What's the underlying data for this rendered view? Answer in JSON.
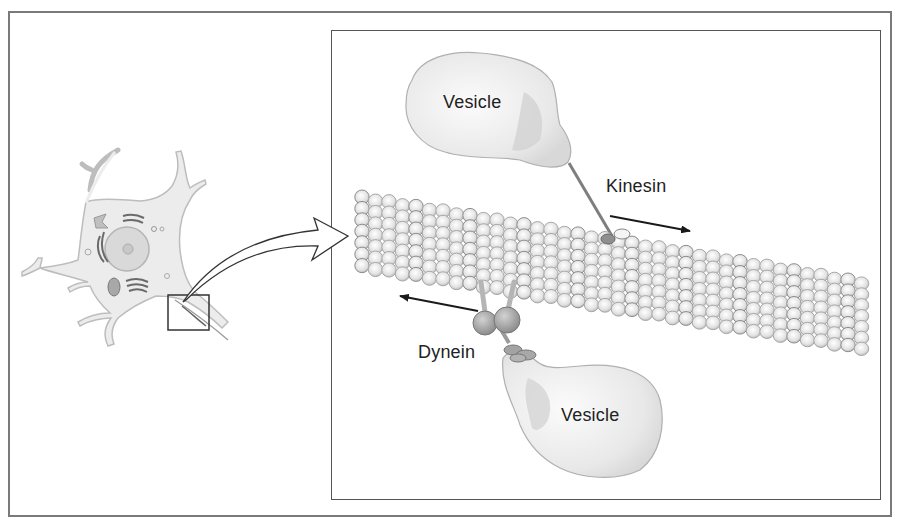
{
  "figure": {
    "left_panel": {
      "subject": "neuron-cell",
      "inset_marker": "zoom-region-box"
    },
    "right_panel": {
      "labels": {
        "vesicle_top": "Vesicle",
        "kinesin": "Kinesin",
        "dynein": "Dynein",
        "vesicle_bottom": "Vesicle"
      },
      "structures": [
        "microtubule",
        "kinesin-motor",
        "dynein-motor",
        "vesicle",
        "vesicle"
      ],
      "arrows": {
        "kinesin_direction": "right",
        "dynein_direction": "left"
      }
    },
    "colors": {
      "frame": "#7a7a7a",
      "panel_border": "#555555",
      "vesicle_fill": "#e9e9e9",
      "tubulin_fill": "#e4e4e4",
      "tubulin_stroke": "#9a9a9a",
      "motor_fill": "#a9a9a9",
      "arrow": "#1a1a1a"
    }
  }
}
